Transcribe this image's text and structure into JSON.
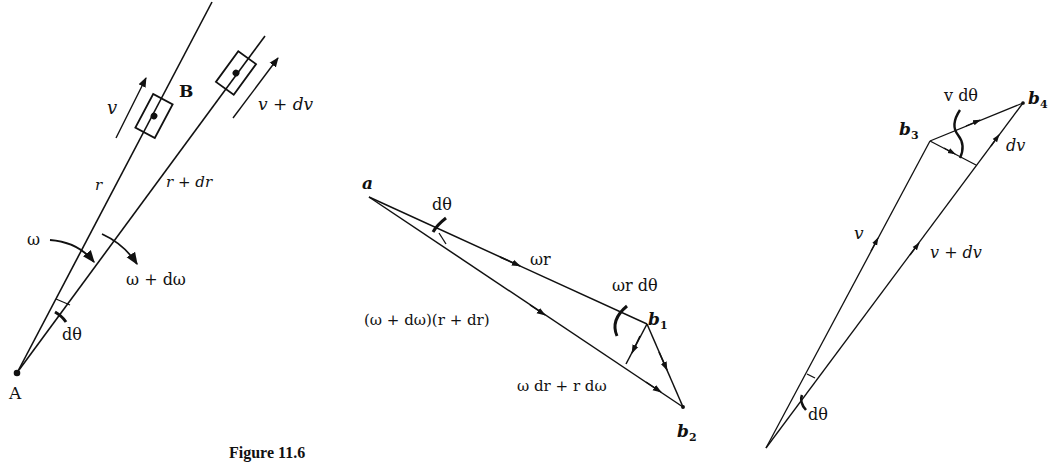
{
  "figure": {
    "caption": "Figure 11.6",
    "panels": [
      {
        "id": "mechanism",
        "labels": {
          "point_A": "A",
          "point_B": "B",
          "v": "v",
          "v_dv": "v + dv",
          "r": "r",
          "r_dr": "r + dr",
          "omega": "ω",
          "omega_domega": "ω + dω",
          "dtheta": "dθ"
        }
      },
      {
        "id": "velocity-triangle",
        "labels": {
          "point_a": "a",
          "dtheta": "dθ",
          "omega_r": "ωr",
          "omega_r_dtheta": "ωr dθ",
          "b1": "b",
          "b1_sub": "1",
          "b2": "b",
          "b2_sub": "2",
          "total": "(ω + dω)(r + dr)",
          "increment": "ω dr + r dω"
        }
      },
      {
        "id": "sliding-velocity-triangle",
        "labels": {
          "b3": "b",
          "b3_sub": "3",
          "b4": "b",
          "b4_sub": "4",
          "v_dtheta": "v dθ",
          "dv": "dv",
          "v": "v",
          "v_dv": "v + dv",
          "dtheta": "dθ"
        }
      }
    ]
  }
}
